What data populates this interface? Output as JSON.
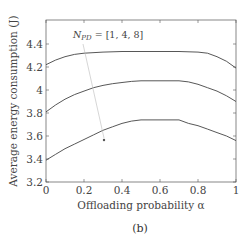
{
  "caption": "(b)",
  "chart_data": {
    "type": "line",
    "title": "",
    "xlabel": "Offloading probability α",
    "ylabel": "Average energy consumption (J)",
    "xlim": [
      0,
      1
    ],
    "ylim": [
      3.2,
      4.6
    ],
    "xticks": [
      "0",
      "0.2",
      "0.4",
      "0.6",
      "0.8",
      "1"
    ],
    "yticks": [
      "3.2",
      "3.4",
      "3.6",
      "3.8",
      "4",
      "4.2",
      "4.4"
    ],
    "grid": false,
    "annotation": {
      "text_main": "N",
      "text_sub": "PD",
      "text_rest": " = [1, 4, 8]",
      "arrow_direction": "from top curve toward bottom curve"
    },
    "series": [
      {
        "name": "N_PD = 1",
        "x": [
          0,
          0.05,
          0.1,
          0.15,
          0.2,
          0.3,
          0.4,
          0.5,
          0.6,
          0.7,
          0.8,
          0.85,
          0.9,
          0.95,
          1.0
        ],
        "y": [
          4.22,
          4.26,
          4.29,
          4.31,
          4.32,
          4.33,
          4.335,
          4.335,
          4.335,
          4.335,
          4.33,
          4.32,
          4.29,
          4.25,
          4.19
        ]
      },
      {
        "name": "N_PD = 4",
        "x": [
          0,
          0.05,
          0.1,
          0.15,
          0.2,
          0.25,
          0.3,
          0.35,
          0.4,
          0.45,
          0.5,
          0.6,
          0.7,
          0.75,
          0.8,
          0.85,
          0.9,
          0.95,
          1.0
        ],
        "y": [
          3.81,
          3.87,
          3.92,
          3.96,
          3.99,
          4.02,
          4.04,
          4.055,
          4.065,
          4.075,
          4.08,
          4.08,
          4.08,
          4.07,
          4.05,
          4.02,
          3.99,
          3.95,
          3.9
        ]
      },
      {
        "name": "N_PD = 8",
        "x": [
          0,
          0.05,
          0.1,
          0.15,
          0.2,
          0.25,
          0.3,
          0.35,
          0.4,
          0.45,
          0.5,
          0.6,
          0.7,
          0.75,
          0.8,
          0.85,
          0.9,
          0.95,
          1.0
        ],
        "y": [
          3.39,
          3.44,
          3.49,
          3.53,
          3.57,
          3.61,
          3.65,
          3.68,
          3.71,
          3.73,
          3.74,
          3.74,
          3.74,
          3.71,
          3.69,
          3.66,
          3.63,
          3.6,
          3.56
        ]
      }
    ]
  }
}
